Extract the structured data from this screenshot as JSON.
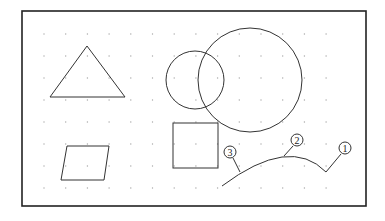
{
  "diagram": {
    "frame": {
      "x": 22,
      "y": 11,
      "w": 344,
      "h": 195,
      "stroke": "#222222"
    },
    "grid": {
      "x0": 44,
      "y0": 34,
      "dx": 21.7,
      "dy": 22,
      "cols": 14,
      "rows": 8,
      "color": "#aaaaaa"
    },
    "shapes": {
      "triangle": {
        "points": "87,46 50,97 125,97"
      },
      "parallelogram": {
        "points": "67,146 109,146 104,180 61,180"
      },
      "small_circle": {
        "cx": 195,
        "cy": 80,
        "r": 29
      },
      "large_circle": {
        "cx": 250,
        "cy": 80,
        "r": 52
      },
      "square": {
        "x": 173,
        "y": 123,
        "w": 45,
        "h": 45
      },
      "arc": {
        "d": "M 222 186 Q 290 135 326 172"
      }
    },
    "callouts": [
      {
        "label": "1",
        "cx": 345,
        "cy": 148,
        "lx1": 326,
        "ly1": 172,
        "lx2": 341,
        "ly2": 154
      },
      {
        "label": "2",
        "cx": 297,
        "cy": 140,
        "lx1": 284,
        "ly1": 156,
        "lx2": 293,
        "ly2": 146
      },
      {
        "label": "3",
        "cx": 230,
        "cy": 152,
        "lx1": 240,
        "ly1": 172,
        "lx2": 233,
        "ly2": 158
      }
    ]
  }
}
